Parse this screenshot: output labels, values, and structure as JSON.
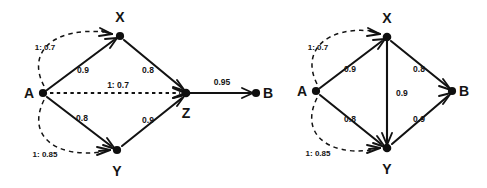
{
  "figure": {
    "background_color": "#ffffff",
    "ink_color": "#121212"
  },
  "diagrams": [
    {
      "id": "left-diagram",
      "name": "graph-with-z-and-b",
      "nodes": [
        {
          "id": "A",
          "label": "A",
          "x": 43,
          "y": 93,
          "label_x": 29,
          "label_y": 98
        },
        {
          "id": "X",
          "label": "X",
          "x": 120,
          "y": 36,
          "label_x": 116,
          "label_y": 22
        },
        {
          "id": "Y",
          "label": "Y",
          "x": 117,
          "y": 150,
          "label_x": 113,
          "label_y": 173
        },
        {
          "id": "Z",
          "label": "Z",
          "x": 186,
          "y": 93,
          "label_x": 182,
          "label_y": 117
        },
        {
          "id": "B",
          "label": "B",
          "x": 256,
          "y": 93,
          "label_x": 267,
          "label_y": 98
        }
      ],
      "edges": [
        {
          "from": "A",
          "to": "X",
          "weight": "0.9",
          "style": "solid",
          "label_x": 83,
          "label_y": 73
        },
        {
          "from": "X",
          "to": "Z",
          "weight": "0.8",
          "style": "solid",
          "label_x": 145,
          "label_y": 73
        },
        {
          "from": "A",
          "to": "Y",
          "weight": "0.8",
          "style": "solid",
          "label_x": 82,
          "label_y": 120
        },
        {
          "from": "Y",
          "to": "Z",
          "weight": "0.9",
          "style": "solid",
          "label_x": 145,
          "label_y": 122
        },
        {
          "from": "A",
          "to": "Z",
          "weight": "1: 0.7",
          "style": "dotted",
          "label_x": 112,
          "label_y": 89
        },
        {
          "from": "Z",
          "to": "B",
          "weight": "0.95",
          "style": "solid",
          "label_x": 222,
          "label_y": 85
        }
      ],
      "arcs": [
        {
          "from": "A",
          "to": "X",
          "label": "1: 0.7",
          "label_x": 45,
          "label_y": 48
        },
        {
          "from": "A",
          "to": "Y",
          "label": "1: 0.85",
          "label_x": 45,
          "label_y": 155
        }
      ]
    },
    {
      "id": "right-diagram",
      "name": "graph-with-direct-b",
      "nodes": [
        {
          "id": "A",
          "label": "A",
          "x": 316,
          "y": 91,
          "label_x": 302,
          "label_y": 96
        },
        {
          "id": "X",
          "label": "X",
          "x": 387,
          "y": 37,
          "label_x": 383,
          "label_y": 23
        },
        {
          "id": "Y",
          "label": "Y",
          "x": 387,
          "y": 148,
          "label_x": 383,
          "label_y": 171
        },
        {
          "id": "B",
          "label": "B",
          "x": 452,
          "y": 91,
          "label_x": 463,
          "label_y": 96
        }
      ],
      "edges": [
        {
          "from": "A",
          "to": "X",
          "weight": "0.9",
          "style": "solid",
          "label_x": 349,
          "label_y": 72
        },
        {
          "from": "X",
          "to": "B",
          "weight": "0.8",
          "style": "solid",
          "label_x": 418,
          "label_y": 72
        },
        {
          "from": "A",
          "to": "Y",
          "weight": "0.8",
          "style": "solid",
          "label_x": 349,
          "label_y": 121
        },
        {
          "from": "Y",
          "to": "B",
          "weight": "0.9",
          "style": "solid",
          "label_x": 418,
          "label_y": 121
        },
        {
          "from": "X",
          "to": "Y",
          "weight": "0.9",
          "style": "solid",
          "label_x": 391,
          "label_y": 96
        }
      ],
      "arcs": [
        {
          "from": "A",
          "to": "X",
          "label": "1: 0.7",
          "label_x": 318,
          "label_y": 48
        },
        {
          "from": "A",
          "to": "Y",
          "label": "1: 0.85",
          "label_x": 318,
          "label_y": 153
        }
      ]
    }
  ]
}
